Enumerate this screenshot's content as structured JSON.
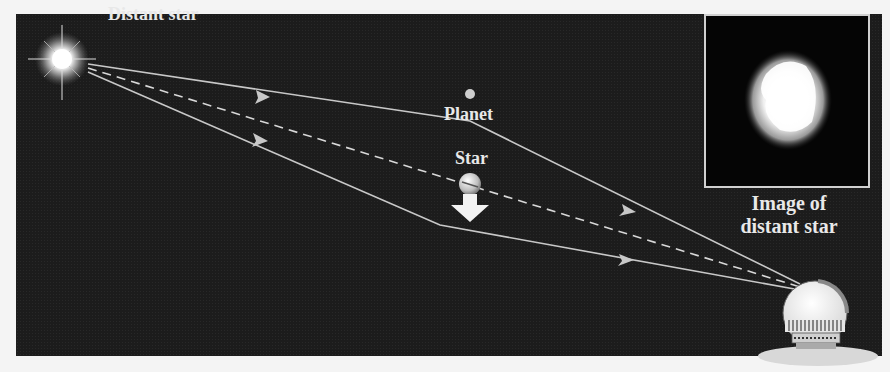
{
  "diagram": {
    "labels": {
      "distant_star": "Distant star",
      "planet": "Planet",
      "star": "Star",
      "image_line1": "Image of",
      "image_line2": "distant star"
    },
    "colors": {
      "background": "#1c1c1c",
      "ray": "#c8c8c8",
      "label": "#e8e8e8",
      "inset_border": "#d0d0d0"
    },
    "elements": [
      "distant-star-source",
      "upper-light-ray",
      "lower-light-ray",
      "dashed-line-of-sight",
      "planet",
      "lens-star",
      "motion-arrow",
      "observatory-telescope",
      "inset-image"
    ]
  }
}
